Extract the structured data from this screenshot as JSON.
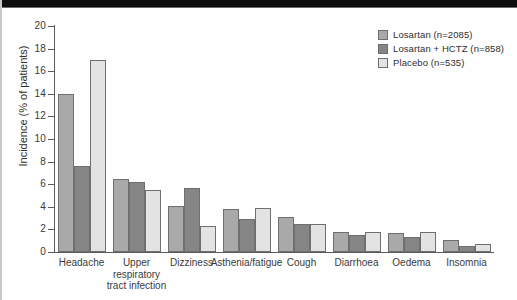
{
  "figure": {
    "background_color": "#fefefe",
    "frame_color": "#c8c8c8",
    "scan_band_color": "#0d0d0d"
  },
  "legend": {
    "position": "top-right",
    "items": [
      {
        "label": "Losartan (n=2085)",
        "color": "#a9a9a9",
        "swatch_name": "legend-swatch-losartan"
      },
      {
        "label": "Losartan + HCTZ (n=858)",
        "color": "#858585",
        "swatch_name": "legend-swatch-losartan-hctz"
      },
      {
        "label": "Placebo (n=535)",
        "color": "#e3e3e3",
        "swatch_name": "legend-swatch-placebo"
      }
    ]
  },
  "chart_data": {
    "type": "bar",
    "title": "",
    "xlabel": "",
    "ylabel": "Incidence (% of patients)",
    "ylim": [
      0,
      20
    ],
    "ytick_step": 2,
    "yticks": [
      "0",
      "2",
      "4",
      "6",
      "8",
      "10",
      "12",
      "14",
      "16",
      "18",
      "20"
    ],
    "grid": false,
    "legend_position": "top-right",
    "categories": [
      "Headache",
      "Upper\nrespiratory\ntract infection",
      "Dizziness",
      "Asthenia/fatigue",
      "Cough",
      "Diarrhoea",
      "Oedema",
      "Insomnia"
    ],
    "series": [
      {
        "name": "Losartan (n=2085)",
        "color": "#a9a9a9",
        "values": [
          14.0,
          6.5,
          4.1,
          3.8,
          3.1,
          1.8,
          1.7,
          1.1
        ]
      },
      {
        "name": "Losartan + HCTZ (n=858)",
        "color": "#858585",
        "values": [
          7.6,
          6.2,
          5.7,
          2.9,
          2.5,
          1.5,
          1.3,
          0.5
        ]
      },
      {
        "name": "Placebo (n=535)",
        "color": "#e3e3e3",
        "values": [
          17.0,
          5.5,
          2.3,
          3.9,
          2.5,
          1.8,
          1.8,
          0.7
        ]
      }
    ]
  }
}
